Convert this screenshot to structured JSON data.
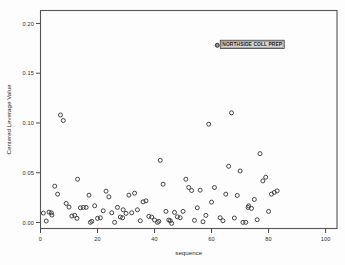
{
  "chart_data": {
    "type": "scatter",
    "title": "",
    "xlabel": "sequence",
    "ylabel": "Centered Leverage Value",
    "xlim": [
      0,
      104
    ],
    "ylim": [
      -0.006,
      0.213
    ],
    "xticks": [
      0,
      20,
      40,
      60,
      80,
      100
    ],
    "xticklabels": [
      "0",
      "20",
      "40",
      "60",
      "80",
      "100"
    ],
    "yticks": [
      0.0,
      0.05,
      0.1,
      0.15,
      0.2
    ],
    "yticklabels": [
      "0.00",
      "0.05",
      "0.10",
      "0.15",
      "0.20"
    ],
    "grid": false,
    "legend": null,
    "marker": "open-circle",
    "marker_color": "#3c3c3c",
    "annotations": [
      {
        "label": "NORTHSIDE COLL PREP",
        "x": 62,
        "y": 0.178,
        "style": "boxed-label-right"
      }
    ],
    "points": [
      {
        "x": 1,
        "y": 0.0095
      },
      {
        "x": 2,
        "y": 0.0015
      },
      {
        "x": 3,
        "y": 0.0105
      },
      {
        "x": 3.8,
        "y": 0.0098
      },
      {
        "x": 4,
        "y": 0.0075
      },
      {
        "x": 5,
        "y": 0.0365
      },
      {
        "x": 6,
        "y": 0.0285
      },
      {
        "x": 7,
        "y": 0.108
      },
      {
        "x": 8,
        "y": 0.1025
      },
      {
        "x": 9,
        "y": 0.0192
      },
      {
        "x": 10,
        "y": 0.0155
      },
      {
        "x": 11,
        "y": 0.0065
      },
      {
        "x": 12,
        "y": 0.0072
      },
      {
        "x": 12.8,
        "y": 0.0042
      },
      {
        "x": 13,
        "y": 0.0435
      },
      {
        "x": 14,
        "y": 0.0148
      },
      {
        "x": 15,
        "y": 0.0152
      },
      {
        "x": 16,
        "y": 0.0152
      },
      {
        "x": 17,
        "y": 0.0275
      },
      {
        "x": 17.5,
        "y": 0.0002
      },
      {
        "x": 18,
        "y": 0.0012
      },
      {
        "x": 19,
        "y": 0.0168
      },
      {
        "x": 20,
        "y": 0.0042
      },
      {
        "x": 21,
        "y": 0.0048
      },
      {
        "x": 22,
        "y": 0.0118
      },
      {
        "x": 23,
        "y": 0.0315
      },
      {
        "x": 24,
        "y": 0.0258
      },
      {
        "x": 25,
        "y": 0.0098
      },
      {
        "x": 26,
        "y": 0.0002
      },
      {
        "x": 27,
        "y": 0.0152
      },
      {
        "x": 28,
        "y": 0.0055
      },
      {
        "x": 28.8,
        "y": 0.0048
      },
      {
        "x": 29,
        "y": 0.0128
      },
      {
        "x": 30,
        "y": 0.0092
      },
      {
        "x": 31,
        "y": 0.0275
      },
      {
        "x": 32,
        "y": 0.0098
      },
      {
        "x": 33,
        "y": 0.0295
      },
      {
        "x": 34,
        "y": 0.0128
      },
      {
        "x": 35,
        "y": 0.0018
      },
      {
        "x": 36,
        "y": 0.0208
      },
      {
        "x": 37,
        "y": 0.0218
      },
      {
        "x": 38,
        "y": 0.0062
      },
      {
        "x": 39,
        "y": 0.0055
      },
      {
        "x": 40,
        "y": 0.0025
      },
      {
        "x": 41,
        "y": 0.0002
      },
      {
        "x": 41.5,
        "y": 0.0012
      },
      {
        "x": 42,
        "y": 0.0625
      },
      {
        "x": 43,
        "y": 0.0385
      },
      {
        "x": 44,
        "y": 0.0112
      },
      {
        "x": 45,
        "y": 0.0025
      },
      {
        "x": 45.5,
        "y": 0.0018
      },
      {
        "x": 46,
        "y": -0.0008
      },
      {
        "x": 47,
        "y": 0.0102
      },
      {
        "x": 48,
        "y": 0.0058
      },
      {
        "x": 49,
        "y": 0.0048
      },
      {
        "x": 50,
        "y": 0.0112
      },
      {
        "x": 51,
        "y": 0.0435
      },
      {
        "x": 52,
        "y": 0.0352
      },
      {
        "x": 53,
        "y": 0.0322
      },
      {
        "x": 54,
        "y": 0.0022
      },
      {
        "x": 55,
        "y": 0.0148
      },
      {
        "x": 56,
        "y": 0.0325
      },
      {
        "x": 57,
        "y": 0.0008
      },
      {
        "x": 58,
        "y": 0.0072
      },
      {
        "x": 59,
        "y": 0.0988
      },
      {
        "x": 60,
        "y": 0.0205
      },
      {
        "x": 61,
        "y": 0.0352
      },
      {
        "x": 62,
        "y": 0.178
      },
      {
        "x": 63,
        "y": 0.0048
      },
      {
        "x": 64,
        "y": 0.0018
      },
      {
        "x": 65,
        "y": 0.0285
      },
      {
        "x": 66,
        "y": 0.0565
      },
      {
        "x": 67,
        "y": 0.1102
      },
      {
        "x": 68,
        "y": 0.0045
      },
      {
        "x": 69,
        "y": 0.0272
      },
      {
        "x": 70,
        "y": 0.0518
      },
      {
        "x": 71,
        "y": 0.0002
      },
      {
        "x": 72,
        "y": 0.0002
      },
      {
        "x": 72.8,
        "y": 0.0152
      },
      {
        "x": 73,
        "y": 0.0168
      },
      {
        "x": 74,
        "y": 0.0142
      },
      {
        "x": 75,
        "y": 0.0232
      },
      {
        "x": 76,
        "y": 0.0028
      },
      {
        "x": 77,
        "y": 0.0692
      },
      {
        "x": 78,
        "y": 0.0418
      },
      {
        "x": 79,
        "y": 0.0455
      },
      {
        "x": 80,
        "y": 0.0112
      },
      {
        "x": 81,
        "y": 0.0285
      },
      {
        "x": 82,
        "y": 0.0302
      },
      {
        "x": 83,
        "y": 0.0318
      }
    ]
  }
}
